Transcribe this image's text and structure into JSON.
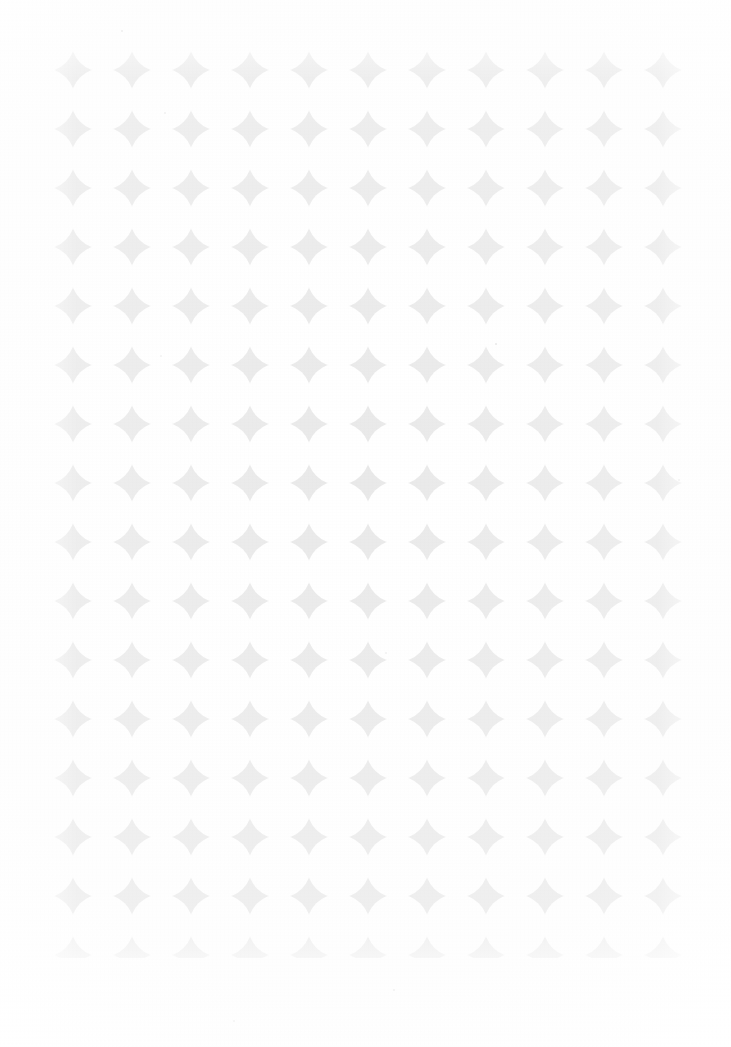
{
  "page": {
    "width": 731,
    "height": 1047,
    "background_color": "#ffffff"
  },
  "pattern": {
    "name": "overlapping-circle-grid",
    "motif": "four-pointed-star-interstice",
    "field_color": "#e9e9e9",
    "circle_color": "#ffffff",
    "columns": 11,
    "rows": 16,
    "pitch_x": 59,
    "pitch_y": 59,
    "circle_radius": 31.5,
    "first_center_x": 73,
    "first_center_y": 70,
    "bounds": {
      "left": 45,
      "top": 42,
      "right": 690,
      "bottom": 958,
      "width": 645,
      "height": 916
    },
    "margins": {
      "left": 45,
      "top": 42,
      "right": 41,
      "bottom": 89
    },
    "star_count": 176
  },
  "specks": [
    {
      "x": 121,
      "y": 30,
      "opacity": 0.35
    },
    {
      "x": 164,
      "y": 112,
      "opacity": 0.3
    },
    {
      "x": 495,
      "y": 343,
      "opacity": 0.45
    },
    {
      "x": 385,
      "y": 652,
      "opacity": 0.3
    },
    {
      "x": 160,
      "y": 355,
      "opacity": 0.25
    },
    {
      "x": 393,
      "y": 989,
      "opacity": 0.28
    },
    {
      "x": 233,
      "y": 1020,
      "opacity": 0.22
    },
    {
      "x": 678,
      "y": 479,
      "opacity": 0.25
    }
  ]
}
